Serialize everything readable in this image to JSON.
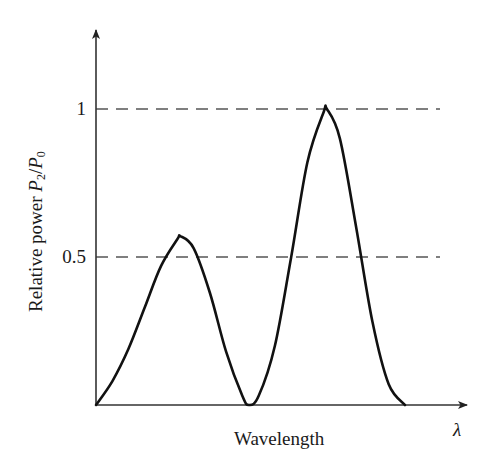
{
  "chart_data": {
    "type": "line",
    "title": "",
    "xlabel": "Wavelength",
    "xsymbol": "λ",
    "ylabel": "Relative power P2/P0",
    "ylabel_parts": {
      "prefix": "Relative power ",
      "num": "P",
      "num_sub": "2",
      "slash": "/",
      "den": "P",
      "den_sub": "0"
    },
    "yticks": [
      {
        "value": 0.5,
        "label": "0.5"
      },
      {
        "value": 1,
        "label": "1"
      }
    ],
    "reference_lines": [
      {
        "y": 0.5,
        "style": "dashed"
      },
      {
        "y": 1,
        "style": "dashed"
      }
    ],
    "ylim": [
      0,
      1.25
    ],
    "xlim": [
      0,
      1.3
    ],
    "grid": false,
    "legend": null,
    "series": [
      {
        "name": "P2/P0",
        "description": "Two lobes: smaller peak ~0.57, zero between, larger peak ~1.0, returning to 0",
        "points": [
          {
            "x": 0.0,
            "y": 0.0
          },
          {
            "x": 0.05,
            "y": 0.08
          },
          {
            "x": 0.1,
            "y": 0.19
          },
          {
            "x": 0.15,
            "y": 0.33
          },
          {
            "x": 0.2,
            "y": 0.47
          },
          {
            "x": 0.25,
            "y": 0.56
          },
          {
            "x": 0.26,
            "y": 0.57
          },
          {
            "x": 0.3,
            "y": 0.53
          },
          {
            "x": 0.35,
            "y": 0.38
          },
          {
            "x": 0.4,
            "y": 0.18
          },
          {
            "x": 0.45,
            "y": 0.03
          },
          {
            "x": 0.47,
            "y": 0.0
          },
          {
            "x": 0.5,
            "y": 0.03
          },
          {
            "x": 0.55,
            "y": 0.2
          },
          {
            "x": 0.6,
            "y": 0.5
          },
          {
            "x": 0.65,
            "y": 0.82
          },
          {
            "x": 0.7,
            "y": 0.99
          },
          {
            "x": 0.71,
            "y": 1.0
          },
          {
            "x": 0.75,
            "y": 0.9
          },
          {
            "x": 0.8,
            "y": 0.6
          },
          {
            "x": 0.85,
            "y": 0.28
          },
          {
            "x": 0.9,
            "y": 0.07
          },
          {
            "x": 0.95,
            "y": 0.0
          }
        ]
      }
    ],
    "colors": {
      "curve": "#111111",
      "axis": "#333333",
      "dashed": "#555555"
    }
  }
}
